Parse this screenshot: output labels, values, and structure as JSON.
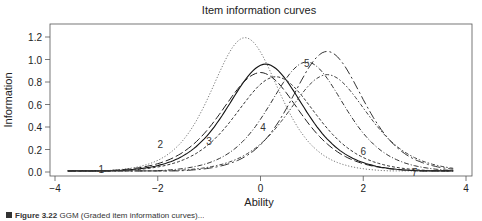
{
  "chart_data": {
    "type": "line",
    "title": "Item information curves",
    "xlabel": "Ability",
    "ylabel": "Information",
    "xlim": [
      -3.75,
      3.75
    ],
    "ylim": [
      0,
      1.25
    ],
    "xticks": [
      "-4",
      "-2",
      "0",
      "2",
      "4"
    ],
    "xtick_values": [
      -4,
      -2,
      0,
      2,
      4
    ],
    "yticks": [
      "0.0",
      "0.2",
      "0.4",
      "0.6",
      "0.8",
      "1.0",
      "1.2"
    ],
    "ytick_values": [
      0,
      0.2,
      0.4,
      0.6,
      0.8,
      1.0,
      1.2
    ],
    "grid": false,
    "legend": "none (inline numeric labels on curves)",
    "series": [
      {
        "name": "1",
        "peak_theta": -0.3,
        "peak_info": 1.25,
        "discrimination": 2.24,
        "style": "dotted",
        "label_at": [
          -3.1,
          0.03
        ]
      },
      {
        "name": "2",
        "peak_theta": 0.1,
        "peak_info": 1.0,
        "discrimination": 2.0,
        "style": "solid",
        "label_at": [
          -1.95,
          0.25
        ]
      },
      {
        "name": "3",
        "peak_theta": 0.3,
        "peak_info": 0.88,
        "discrimination": 1.88,
        "style": "short-dash",
        "label_at": [
          -1.0,
          0.28
        ]
      },
      {
        "name": "4",
        "peak_theta": 0.9,
        "peak_info": 1.02,
        "discrimination": 2.02,
        "style": "dash-dot",
        "label_at": [
          0.05,
          0.4
        ]
      },
      {
        "name": "5",
        "peak_theta": 0.0,
        "peak_info": 0.92,
        "discrimination": 1.92,
        "style": "long-dash",
        "label_at": [
          0.9,
          0.97
        ]
      },
      {
        "name": "6",
        "peak_theta": 1.3,
        "peak_info": 0.9,
        "discrimination": 1.9,
        "style": "dash-dot-short",
        "label_at": [
          2.0,
          0.19
        ]
      },
      {
        "name": "7",
        "peak_theta": 1.3,
        "peak_info": 1.12,
        "discrimination": 2.12,
        "style": "long-dash-dot",
        "label_at": [
          3.0,
          0.0
        ]
      }
    ]
  },
  "caption": {
    "figure_label": "Figure 3.22",
    "text": "GGM (Graded item information curves)..."
  }
}
